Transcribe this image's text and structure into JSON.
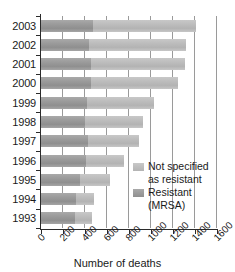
{
  "chart_data": {
    "type": "bar",
    "orientation": "horizontal",
    "stacked": true,
    "title": "",
    "xlabel": "Number of deaths",
    "ylabel": "",
    "xlim": [
      0,
      1600
    ],
    "xticks": [
      0,
      200,
      400,
      600,
      800,
      1000,
      1200,
      1400,
      1600
    ],
    "xtick_labels": [
      "0",
      "200",
      "400",
      "600",
      "800",
      "1000",
      "1200",
      "1400",
      "1600"
    ],
    "categories": [
      "2003",
      "2002",
      "2001",
      "2000",
      "1999",
      "1998",
      "1997",
      "1996",
      "1995",
      "1994",
      "1993"
    ],
    "grid": "vertical",
    "legend_position": "inside-right",
    "series": [
      {
        "name": "Resistant (MRSA)",
        "color": "#9b9b9b",
        "values": [
          470,
          440,
          450,
          450,
          415,
          400,
          430,
          410,
          355,
          320,
          310
        ]
      },
      {
        "name": "Not specified as resistant",
        "color": "#bdbdbd",
        "values": [
          940,
          880,
          860,
          795,
          615,
          530,
          460,
          345,
          275,
          160,
          155
        ]
      }
    ],
    "totals": [
      1410,
      1320,
      1310,
      1245,
      1030,
      930,
      890,
      755,
      630,
      480,
      465
    ]
  },
  "legend": {
    "items": [
      {
        "label_line1": "Not specified",
        "label_line2": "as resistant",
        "series": "Not specified as resistant"
      },
      {
        "label_line1": "Resistant",
        "label_line2": "(MRSA)",
        "series": "Resistant (MRSA)"
      }
    ]
  },
  "axis": {
    "x_title": "Number of deaths"
  }
}
